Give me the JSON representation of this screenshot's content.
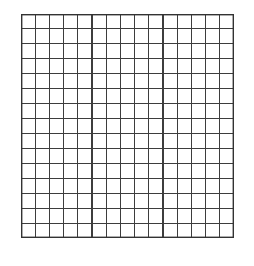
{
  "page": {
    "background_color": "#ffffff",
    "width": 254,
    "height": 266
  },
  "figure": {
    "name": "square-grid",
    "origin_x": 21,
    "origin_y": 14,
    "width": 213,
    "height": 224,
    "columns": 15,
    "rows": 15,
    "cell_width": 14.2,
    "cell_height": 14.93,
    "line_color": "#3d3d3d",
    "border_color": "#333333",
    "fill_color": "#ffffff",
    "line_width": 1.1,
    "border_width": 1.4,
    "has_labels": false,
    "has_axis_ticks": false
  },
  "chart_data": {
    "type": "table",
    "title": "",
    "xlabel": "",
    "ylabel": "",
    "columns": 15,
    "rows": 15,
    "categories": [],
    "values": [],
    "grid": true,
    "legend": null,
    "annotations": [],
    "cells_empty": true,
    "vertical_line_positions": [
      0,
      14.2,
      28.4,
      42.6,
      56.8,
      71,
      85.2,
      99.4,
      113.6,
      127.8,
      142,
      156.2,
      170.4,
      184.6,
      198.8,
      213
    ],
    "horizontal_line_positions": [
      0,
      14.93,
      29.87,
      44.8,
      59.73,
      74.67,
      89.6,
      104.53,
      119.47,
      134.4,
      149.33,
      164.27,
      179.2,
      194.13,
      209.07,
      224
    ]
  }
}
